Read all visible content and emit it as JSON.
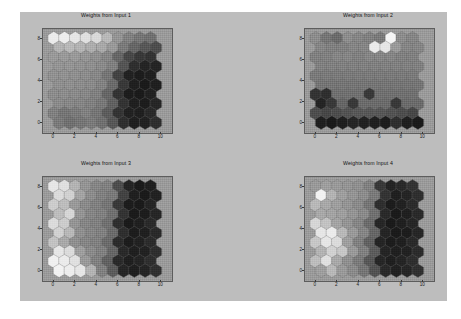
{
  "figure": {
    "background_color": "#bdbdbd",
    "axes_background_color": "#9a9a9a",
    "axes_border_color": "#5d5d5d",
    "tick_color": "#1a1a1a"
  },
  "chart_data": {
    "type": "heatmap",
    "title": "",
    "subplot_layout": "2x2",
    "colormap": "gray",
    "grid_type": "hexagonal",
    "grid_rows": 10,
    "grid_cols": 10,
    "xlabel": "",
    "ylabel": "",
    "xlim": [
      -1,
      11
    ],
    "ylim": [
      -1,
      9
    ],
    "xticks": [
      0,
      2,
      4,
      6,
      8,
      10
    ],
    "yticks": [
      0,
      2,
      4,
      6,
      8
    ],
    "xticklabels": [
      "0",
      "2",
      "4",
      "6",
      "8",
      "10"
    ],
    "yticklabels": [
      "0",
      "2",
      "4",
      "6",
      "8"
    ],
    "grid": false,
    "legend": "none",
    "panels": [
      {
        "id": "panel-1",
        "title": "Weights from Input 1",
        "values": [
          [
            0.92,
            0.93,
            0.9,
            0.88,
            0.85,
            0.72,
            0.58,
            0.5,
            0.46,
            0.44
          ],
          [
            0.7,
            0.72,
            0.7,
            0.68,
            0.66,
            0.6,
            0.48,
            0.4,
            0.34,
            0.3
          ],
          [
            0.6,
            0.6,
            0.6,
            0.58,
            0.56,
            0.52,
            0.4,
            0.28,
            0.22,
            0.2
          ],
          [
            0.58,
            0.58,
            0.57,
            0.56,
            0.54,
            0.5,
            0.33,
            0.18,
            0.14,
            0.14
          ],
          [
            0.57,
            0.57,
            0.56,
            0.55,
            0.53,
            0.46,
            0.26,
            0.13,
            0.11,
            0.12
          ],
          [
            0.56,
            0.56,
            0.55,
            0.54,
            0.51,
            0.42,
            0.22,
            0.12,
            0.1,
            0.12
          ],
          [
            0.55,
            0.55,
            0.54,
            0.53,
            0.5,
            0.4,
            0.2,
            0.11,
            0.1,
            0.13
          ],
          [
            0.54,
            0.53,
            0.52,
            0.5,
            0.47,
            0.38,
            0.2,
            0.12,
            0.11,
            0.15
          ],
          [
            0.5,
            0.46,
            0.48,
            0.5,
            0.46,
            0.36,
            0.2,
            0.13,
            0.12,
            0.16
          ],
          [
            0.48,
            0.44,
            0.46,
            0.48,
            0.44,
            0.34,
            0.18,
            0.12,
            0.13,
            0.18
          ]
        ]
      },
      {
        "id": "panel-2",
        "title": "Weights from Input 2",
        "values": [
          [
            0.55,
            0.46,
            0.42,
            0.55,
            0.52,
            0.5,
            0.48,
            0.96,
            0.55,
            0.52
          ],
          [
            0.52,
            0.5,
            0.5,
            0.52,
            0.52,
            0.92,
            0.9,
            0.6,
            0.52,
            0.52
          ],
          [
            0.5,
            0.5,
            0.52,
            0.52,
            0.5,
            0.52,
            0.52,
            0.52,
            0.5,
            0.5
          ],
          [
            0.5,
            0.5,
            0.5,
            0.5,
            0.5,
            0.5,
            0.5,
            0.5,
            0.5,
            0.5
          ],
          [
            0.48,
            0.48,
            0.48,
            0.48,
            0.48,
            0.48,
            0.48,
            0.48,
            0.48,
            0.48
          ],
          [
            0.46,
            0.46,
            0.46,
            0.46,
            0.46,
            0.46,
            0.46,
            0.46,
            0.46,
            0.46
          ],
          [
            0.2,
            0.18,
            0.44,
            0.44,
            0.44,
            0.22,
            0.44,
            0.44,
            0.44,
            0.44
          ],
          [
            0.14,
            0.22,
            0.4,
            0.22,
            0.42,
            0.42,
            0.42,
            0.22,
            0.42,
            0.42
          ],
          [
            0.3,
            0.28,
            0.3,
            0.32,
            0.34,
            0.34,
            0.34,
            0.32,
            0.3,
            0.28
          ],
          [
            0.12,
            0.1,
            0.12,
            0.14,
            0.13,
            0.12,
            0.11,
            0.18,
            0.12,
            0.1
          ]
        ]
      },
      {
        "id": "panel-3",
        "title": "Weights from Input 3",
        "values": [
          [
            0.9,
            0.88,
            0.7,
            0.58,
            0.52,
            0.5,
            0.3,
            0.14,
            0.1,
            0.12
          ],
          [
            0.86,
            0.82,
            0.64,
            0.55,
            0.5,
            0.48,
            0.26,
            0.12,
            0.1,
            0.13
          ],
          [
            0.8,
            0.74,
            0.6,
            0.54,
            0.5,
            0.46,
            0.22,
            0.11,
            0.1,
            0.14
          ],
          [
            0.74,
            0.84,
            0.58,
            0.52,
            0.5,
            0.44,
            0.2,
            0.1,
            0.11,
            0.15
          ],
          [
            0.86,
            0.8,
            0.58,
            0.52,
            0.5,
            0.44,
            0.18,
            0.1,
            0.12,
            0.16
          ],
          [
            0.82,
            0.72,
            0.56,
            0.52,
            0.5,
            0.42,
            0.18,
            0.11,
            0.12,
            0.16
          ],
          [
            0.76,
            0.66,
            0.56,
            0.52,
            0.5,
            0.42,
            0.17,
            0.11,
            0.13,
            0.17
          ],
          [
            0.9,
            0.86,
            0.62,
            0.54,
            0.5,
            0.4,
            0.16,
            0.12,
            0.13,
            0.18
          ],
          [
            0.94,
            0.92,
            0.88,
            0.6,
            0.5,
            0.38,
            0.16,
            0.12,
            0.14,
            0.18
          ],
          [
            0.95,
            0.93,
            0.9,
            0.7,
            0.5,
            0.36,
            0.15,
            0.12,
            0.14,
            0.19
          ]
        ]
      },
      {
        "id": "panel-4",
        "title": "Weights from Input 4",
        "values": [
          [
            0.6,
            0.62,
            0.6,
            0.58,
            0.56,
            0.5,
            0.22,
            0.14,
            0.16,
            0.2
          ],
          [
            0.95,
            0.7,
            0.62,
            0.58,
            0.55,
            0.48,
            0.2,
            0.12,
            0.14,
            0.18
          ],
          [
            0.72,
            0.66,
            0.62,
            0.58,
            0.54,
            0.46,
            0.18,
            0.11,
            0.13,
            0.17
          ],
          [
            0.66,
            0.64,
            0.62,
            0.58,
            0.54,
            0.44,
            0.16,
            0.1,
            0.12,
            0.16
          ],
          [
            0.84,
            0.76,
            0.64,
            0.58,
            0.52,
            0.42,
            0.15,
            0.1,
            0.12,
            0.15
          ],
          [
            0.9,
            0.92,
            0.72,
            0.6,
            0.52,
            0.4,
            0.14,
            0.1,
            0.11,
            0.15
          ],
          [
            0.78,
            0.9,
            0.86,
            0.62,
            0.5,
            0.38,
            0.14,
            0.11,
            0.12,
            0.16
          ],
          [
            0.7,
            0.82,
            0.78,
            0.6,
            0.5,
            0.36,
            0.14,
            0.12,
            0.13,
            0.17
          ],
          [
            0.74,
            0.88,
            0.66,
            0.56,
            0.48,
            0.34,
            0.15,
            0.12,
            0.14,
            0.18
          ],
          [
            0.62,
            0.72,
            0.6,
            0.54,
            0.46,
            0.32,
            0.16,
            0.13,
            0.15,
            0.19
          ]
        ]
      }
    ]
  }
}
